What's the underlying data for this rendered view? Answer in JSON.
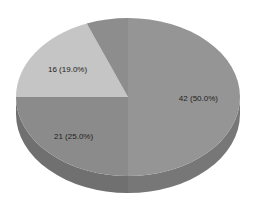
{
  "chart_data": {
    "type": "pie",
    "style": "3d",
    "title": "",
    "legend": "none",
    "start_angle_deg": 0,
    "direction": "clockwise",
    "slices": [
      {
        "label": "42 (50.0%)",
        "value": 42,
        "percent": 50.0,
        "color": "#959595",
        "side_color": "#777777",
        "show_label": true
      },
      {
        "label": "21 (25.0%)",
        "value": 21,
        "percent": 25.0,
        "color": "#8b8b8b",
        "side_color": "#707070",
        "show_label": true
      },
      {
        "label": "16 (19.0%)",
        "value": 16,
        "percent": 19.0,
        "color": "#c5c5c5",
        "side_color": "#9e9e9e",
        "show_label": true
      },
      {
        "label": "",
        "value": 5,
        "percent": 6.0,
        "color": "#8d8d8d",
        "side_color": "#727272",
        "show_label": false
      }
    ],
    "geometry": {
      "cx": 128,
      "cy": 97,
      "rx": 112,
      "ry": 79,
      "depth": 17
    }
  }
}
